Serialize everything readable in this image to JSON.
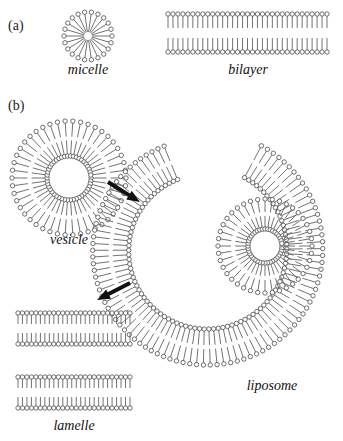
{
  "figure": {
    "width": 343,
    "height": 441,
    "background": "#ffffff",
    "line_color": "#5a5a5a",
    "head_fill": "#ffffff",
    "text_color": "#111111"
  },
  "panels": [
    {
      "id": "a",
      "label": "(a)",
      "x": 8,
      "y": 18
    },
    {
      "id": "b",
      "label": "(b)",
      "x": 8,
      "y": 98
    }
  ],
  "labels": {
    "micelle": "micelle",
    "bilayer": "bilayer",
    "vesicle": "vesicle",
    "liposome": "liposome",
    "lamelle": "lamelle"
  },
  "structures": [
    {
      "name": "micelle",
      "type": "radial-monolayer",
      "cx": 88,
      "cy": 36,
      "inner_radius": 4,
      "outer_radius": 24,
      "head_radius": 2.2,
      "count": 22,
      "label": "micelle",
      "label_x": 88,
      "label_y": 62
    },
    {
      "name": "bilayer",
      "type": "flat-bilayer",
      "x_start": 168,
      "x_end": 327,
      "top_head_y": 14,
      "bottom_head_y": 52,
      "tail_length": 14,
      "head_radius": 2.2,
      "count": 33,
      "label": "bilayer",
      "label_x": 248,
      "label_y": 62
    },
    {
      "name": "vesicle",
      "type": "radial-bilayer",
      "cx": 69,
      "cy": 178,
      "inner_head_radius": 22,
      "outer_head_radius": 57,
      "head_radius": 2.2,
      "count": 46,
      "label": "vesicle",
      "label_x": 69,
      "label_y": 232
    },
    {
      "name": "liposome-spiral",
      "type": "spiral-bilayer",
      "cx": 206,
      "cy": 250,
      "start_angle_deg": -62,
      "end_angle_deg": 248,
      "inner_head_radius": 82,
      "outer_head_radius": 118,
      "head_radius": 2.2,
      "count": 92,
      "label": "liposome",
      "label_x": 272,
      "label_y": 378
    },
    {
      "name": "liposome-inner-vesicle",
      "type": "radial-bilayer",
      "cx": 265,
      "cy": 246,
      "inner_head_radius": 17,
      "outer_head_radius": 47,
      "head_radius": 2.2,
      "count": 40
    },
    {
      "name": "lamelle-bilayer-top",
      "type": "flat-bilayer",
      "x_start": 18,
      "x_end": 130,
      "top_head_y": 313,
      "bottom_head_y": 344,
      "tail_length": 11,
      "head_radius": 2.2,
      "count": 26
    },
    {
      "name": "lamelle-bilayer-bottom",
      "type": "flat-bilayer",
      "x_start": 18,
      "x_end": 130,
      "top_head_y": 377,
      "bottom_head_y": 408,
      "tail_length": 11,
      "head_radius": 2.2,
      "count": 26,
      "label": "lamelle",
      "label_x": 74,
      "label_y": 418
    }
  ],
  "arrows": [
    {
      "name": "arrow-vesicle-to-liposome",
      "x1": 108,
      "y1": 182,
      "x2": 140,
      "y2": 202,
      "direction": "down-right"
    },
    {
      "name": "arrow-liposome-to-lamelle",
      "x1": 130,
      "y1": 283,
      "x2": 97,
      "y2": 300,
      "direction": "down-left"
    }
  ]
}
